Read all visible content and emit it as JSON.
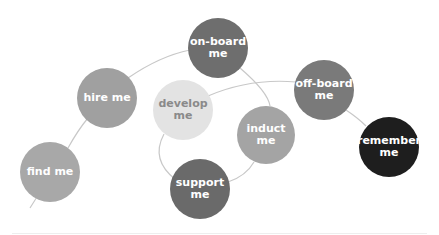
{
  "diagram": {
    "line_color": "#c8c8c8",
    "nodes": [
      {
        "id": "find",
        "line1": "find me",
        "line2": "",
        "cx": 50,
        "cy": 172,
        "r": 30,
        "fill": "#a8a8a8",
        "text": "#ffffff"
      },
      {
        "id": "hire",
        "line1": "hire me",
        "line2": "",
        "cx": 107,
        "cy": 98,
        "r": 30,
        "fill": "#a0a0a0",
        "text": "#ffffff"
      },
      {
        "id": "onboard",
        "line1": "on-board",
        "line2": "me",
        "cx": 218,
        "cy": 48,
        "r": 30,
        "fill": "#6e6e6e",
        "text": "#ffffff"
      },
      {
        "id": "develop",
        "line1": "develop",
        "line2": "me",
        "cx": 183,
        "cy": 110,
        "r": 30,
        "fill": "#e3e3e3",
        "text": "#8a8a8a"
      },
      {
        "id": "induct",
        "line1": "induct",
        "line2": "me",
        "cx": 266,
        "cy": 135,
        "r": 29,
        "fill": "#a4a4a4",
        "text": "#ffffff"
      },
      {
        "id": "support",
        "line1": "support",
        "line2": "me",
        "cx": 200,
        "cy": 189,
        "r": 30,
        "fill": "#6a6a6a",
        "text": "#ffffff"
      },
      {
        "id": "offboard",
        "line1": "off-board",
        "line2": "me",
        "cx": 324,
        "cy": 90,
        "r": 30,
        "fill": "#7a7a7a",
        "text": "#ffffff"
      },
      {
        "id": "remember",
        "line1": "remember",
        "line2": "me",
        "cx": 389,
        "cy": 147,
        "r": 30,
        "fill": "#1e1e1e",
        "text": "#ffffff"
      }
    ]
  }
}
